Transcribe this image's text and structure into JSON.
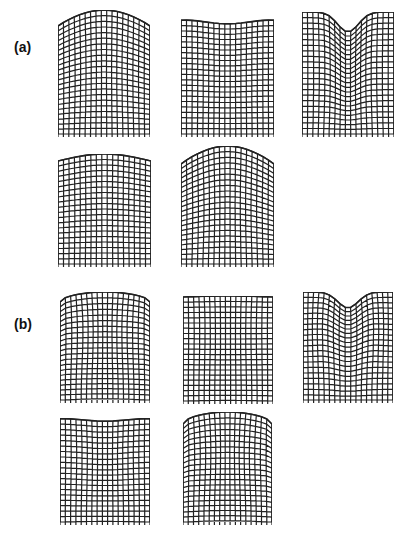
{
  "figure": {
    "labels": [
      {
        "id": "a",
        "text": "(a)",
        "x": 14,
        "y": 39
      },
      {
        "id": "b",
        "text": "(b)",
        "x": 14,
        "y": 316
      }
    ],
    "line_color": "#222222",
    "panels": [
      {
        "group": "a",
        "index": 1,
        "x": 58,
        "y": 10,
        "w": 92,
        "h": 124,
        "cols": 17,
        "rows": 22,
        "top_shape": "dome",
        "amp": 16,
        "bulge": 0
      },
      {
        "group": "a",
        "index": 2,
        "x": 181,
        "y": 19,
        "w": 93,
        "h": 115,
        "cols": 17,
        "rows": 21,
        "top_shape": "shallow-dip",
        "amp": 6,
        "bulge": 0
      },
      {
        "group": "a",
        "index": 3,
        "x": 302,
        "y": 12,
        "w": 92,
        "h": 122,
        "cols": 17,
        "rows": 22,
        "top_shape": "deep-dip",
        "amp": 20,
        "bulge": 0
      },
      {
        "group": "a",
        "index": 4,
        "x": 58,
        "y": 154,
        "w": 93,
        "h": 110,
        "cols": 17,
        "rows": 20,
        "top_shape": "low-dome",
        "amp": 7,
        "bulge": 0
      },
      {
        "group": "a",
        "index": 5,
        "x": 181,
        "y": 146,
        "w": 93,
        "h": 118,
        "cols": 17,
        "rows": 21,
        "top_shape": "dome",
        "amp": 18,
        "bulge": 0
      },
      {
        "group": "b",
        "index": 1,
        "x": 60,
        "y": 292,
        "w": 90,
        "h": 108,
        "cols": 17,
        "rows": 20,
        "top_shape": "flat-dome",
        "amp": 10,
        "bulge": 1
      },
      {
        "group": "b",
        "index": 2,
        "x": 183,
        "y": 296,
        "w": 90,
        "h": 105,
        "cols": 17,
        "rows": 20,
        "top_shape": "flat",
        "amp": 2,
        "bulge": 0.5
      },
      {
        "group": "b",
        "index": 3,
        "x": 303,
        "y": 292,
        "w": 90,
        "h": 108,
        "cols": 17,
        "rows": 20,
        "top_shape": "deep-dip",
        "amp": 16,
        "bulge": -1
      },
      {
        "group": "b",
        "index": 4,
        "x": 60,
        "y": 418,
        "w": 90,
        "h": 104,
        "cols": 17,
        "rows": 19,
        "top_shape": "shallow-dip",
        "amp": 4,
        "bulge": 0.5
      },
      {
        "group": "b",
        "index": 5,
        "x": 183,
        "y": 412,
        "w": 89,
        "h": 110,
        "cols": 17,
        "rows": 20,
        "top_shape": "flat-dome",
        "amp": 12,
        "bulge": 1
      }
    ]
  }
}
